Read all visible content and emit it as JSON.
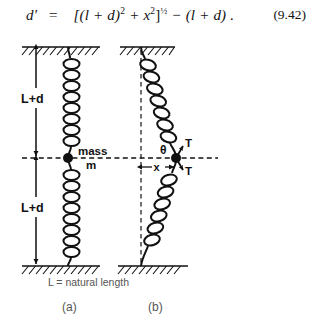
{
  "equation": {
    "lhs": "d′",
    "eq_sign": "=",
    "rhs_open": "[(l + d)",
    "rhs_sq1": "2",
    "rhs_mid": " + x",
    "rhs_sq2": "2",
    "rhs_close": "]",
    "rhs_exp": "½",
    "rhs_minus": " − (l + d) .",
    "number": "(9.42)",
    "full_text": "d′ = [(l + d)² + x²]½ − (l + d) ."
  },
  "figure": {
    "panel_a": {
      "caption": "(a)",
      "dimension_top_label": "L+d",
      "dimension_bottom_label": "L+d",
      "mass_label_line1": "mass",
      "mass_label_line2": "m",
      "natural_length_note": "L = natural length"
    },
    "panel_b": {
      "caption": "(b)",
      "angle_label": "θ",
      "tension_label_upper": "T",
      "tension_label_lower": "T",
      "displacement_label": "x"
    }
  },
  "colors": {
    "ink": "#111111",
    "caption_gray": "#555555",
    "background": "#ffffff"
  }
}
